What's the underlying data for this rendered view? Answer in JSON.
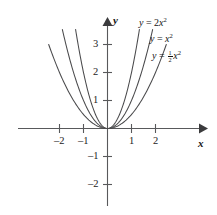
{
  "chart_data": {
    "type": "line",
    "title": "",
    "xlabel": "x",
    "ylabel": "y",
    "xlim": [
      -2.6,
      2.9
    ],
    "ylim": [
      -2.45,
      3.5
    ],
    "xticks": [
      -2,
      -1,
      1,
      2
    ],
    "yticks": [
      -2,
      -1,
      1,
      2,
      3
    ],
    "xtick_labels": [
      "-2",
      "-1",
      "1",
      "2"
    ],
    "ytick_labels": [
      "-2",
      "-1",
      "1",
      "2",
      "3"
    ],
    "grid": false,
    "legend": "inline-curve-labels",
    "series": [
      {
        "name": "y = 2x^2",
        "coefficient": 2,
        "label_html": "<i>y</i> = 2<i>x</i><sup>2</sup>",
        "x": [
          -1.33,
          -1.1,
          -0.9,
          -0.7,
          -0.5,
          -0.3,
          -0.15,
          0,
          0.15,
          0.3,
          0.5,
          0.7,
          0.9,
          1.1,
          1.33
        ],
        "y": [
          3.54,
          2.42,
          1.62,
          0.98,
          0.5,
          0.18,
          0.045,
          0,
          0.045,
          0.18,
          0.5,
          0.98,
          1.62,
          2.42,
          3.54
        ]
      },
      {
        "name": "y = x^2",
        "coefficient": 1,
        "label_html": "<i>y</i> = <i>x</i><sup>2</sup>",
        "x": [
          -1.88,
          -1.6,
          -1.3,
          -1.0,
          -0.75,
          -0.5,
          -0.25,
          0,
          0.25,
          0.5,
          0.75,
          1.0,
          1.3,
          1.6,
          1.88
        ],
        "y": [
          3.53,
          2.56,
          1.69,
          1.0,
          0.56,
          0.25,
          0.0625,
          0,
          0.0625,
          0.25,
          0.56,
          1.0,
          1.69,
          2.56,
          3.53
        ]
      },
      {
        "name": "y = 1/2 x^2",
        "coefficient": 0.5,
        "label_html": "<i>y</i> = <span class=\"frac\"><span class=\"num\">1</span><span class=\"den\">2</span></span><i>x</i><sup>2</sup>",
        "x": [
          -2.45,
          -2.1,
          -1.8,
          -1.5,
          -1.2,
          -0.9,
          -0.6,
          -0.3,
          0,
          0.3,
          0.6,
          0.9,
          1.2,
          1.5,
          1.8,
          2.1,
          2.45
        ],
        "y": [
          3.0,
          2.2,
          1.62,
          1.125,
          0.72,
          0.405,
          0.18,
          0.045,
          0,
          0.045,
          0.18,
          0.405,
          0.72,
          1.125,
          1.62,
          2.2,
          3.0
        ]
      }
    ],
    "axis_labels": {
      "x_axis": "x",
      "y_axis": "y"
    },
    "colors": {
      "background": "#ffffff",
      "axis": "#58595b",
      "curve": "#4a4a4c",
      "text": "#151515"
    }
  },
  "labels": {
    "y_axis_name": "y",
    "x_axis_name": "x",
    "tick_x_neg2": "–2",
    "tick_x_neg1": "–1",
    "tick_x_pos1": "1",
    "tick_x_pos2": "2",
    "tick_y_pos1": "1",
    "tick_y_pos2": "2",
    "tick_y_pos3": "3",
    "tick_y_neg1": "–1",
    "tick_y_neg2": "–2"
  }
}
